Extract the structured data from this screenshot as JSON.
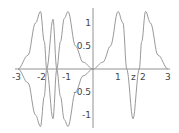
{
  "chart_data": {
    "type": "line",
    "title": "",
    "xlabel": "z",
    "ylabel": "",
    "xlim": [
      -3,
      3
    ],
    "ylim": [
      -1.3,
      1.3
    ],
    "grid": false,
    "x_ticks": [
      "-3",
      "-2",
      "-1",
      "1",
      "2",
      "3"
    ],
    "y_ticks": [
      "1",
      "0.5",
      "-0.5",
      "-1"
    ],
    "series": [
      {
        "name": "upper",
        "x": [
          -3,
          -2.6,
          -2.3,
          -2.1,
          -1.95,
          -1.85,
          -1.6,
          -1.45,
          -1.3,
          -1.15,
          -1.0,
          -0.7,
          -0.4,
          0,
          0.4,
          0.7,
          1.0,
          1.2,
          1.35,
          1.6,
          1.85,
          1.95,
          2.1,
          2.3,
          2.6,
          3
        ],
        "y": [
          0,
          0.3,
          1.0,
          1.25,
          0.6,
          0,
          -1.08,
          0,
          0.6,
          1.1,
          1.25,
          0.5,
          0.15,
          0,
          0.15,
          0.5,
          1.25,
          1.0,
          0,
          -1.08,
          0,
          0.6,
          1.25,
          1.0,
          0.3,
          0
        ]
      },
      {
        "name": "lower",
        "x": [
          -3,
          -2.6,
          -2.3,
          -2.1,
          -1.95,
          -1.85,
          -1.6,
          -1.45,
          -1.3,
          -1.15,
          -1.0,
          -0.7,
          -0.4,
          0
        ],
        "y": [
          0,
          -0.3,
          -1.0,
          -1.25,
          -0.6,
          0,
          1.08,
          0,
          -0.6,
          -1.1,
          -1.25,
          -0.5,
          -0.15,
          0
        ]
      }
    ]
  }
}
